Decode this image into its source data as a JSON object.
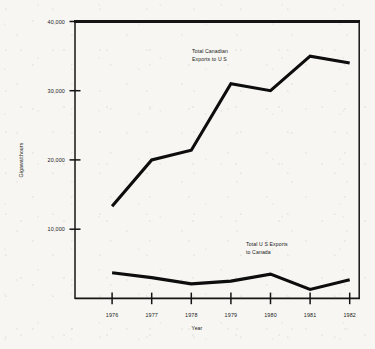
{
  "chart_data": {
    "type": "line",
    "title": "",
    "xlabel": "Year",
    "ylabel": "Gigawatthours",
    "x": [
      1976,
      1977,
      1978,
      1979,
      1980,
      1981,
      1982
    ],
    "xticklabels": [
      "1976",
      "1977",
      "1978",
      "1979",
      "1980",
      "1981",
      "1982"
    ],
    "yticks": [
      10000,
      20000,
      30000,
      40000
    ],
    "yticklabels": [
      "10,000",
      "20,000",
      "30,000",
      "40,000"
    ],
    "ylim": [
      0,
      40000
    ],
    "xlim": [
      1975.4,
      1982.6
    ],
    "grid": false,
    "legend": "none",
    "series": [
      {
        "name": "Total Canadian Exports to U S",
        "annotation": [
          "Total Canadian",
          "Exports to U S"
        ],
        "values": [
          13300,
          20000,
          21400,
          31000,
          30000,
          35000,
          34000
        ]
      },
      {
        "name": "Total U S Exports to Canada",
        "annotation": [
          "Total U S  Exports",
          "to Canada"
        ],
        "values": [
          3700,
          3000,
          2100,
          2500,
          3500,
          1300,
          2700
        ]
      }
    ],
    "colors": {
      "line": "#0d0d0d",
      "axis": "#141414",
      "background": "#f7f6f2",
      "text": "#1b1b1b"
    }
  }
}
